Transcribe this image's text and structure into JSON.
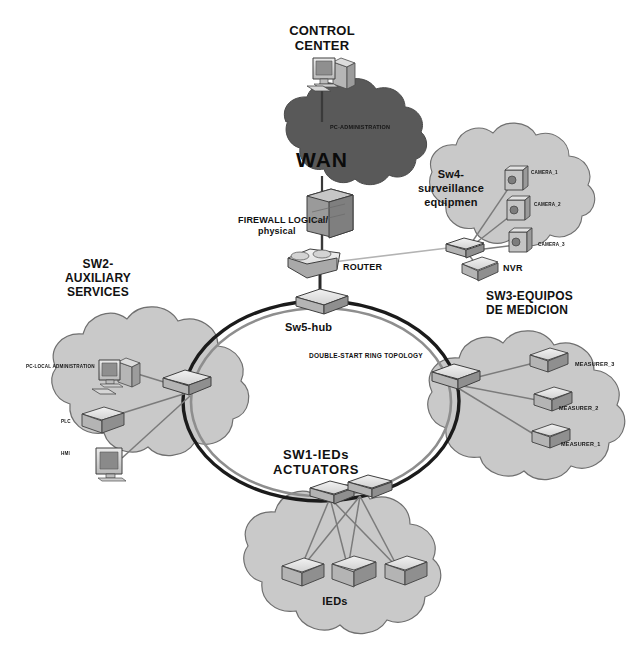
{
  "diagram": {
    "type": "network-topology-diagram",
    "background": "#ffffff"
  },
  "colors": {
    "wan_cloud": "#595959",
    "zone_cloud": "#c9c9c9",
    "cloud_outline": "#6e6e6e",
    "ring_line": "#1a1a1a",
    "ring_inner_line": "#8a8a8a",
    "link_line": "#777777",
    "device_fill": "#d9d9d9",
    "device_shade": "#a8a8a8",
    "device_outline": "#4a4a4a",
    "text": "#111111"
  },
  "nodes": {
    "control_center": {
      "label": "CONTROL\nCENTER",
      "label_line1": "CONTROL",
      "label_line2": "CENTER",
      "icon": "desktop-computer"
    },
    "wan": {
      "label": "WAN",
      "icon": "cloud",
      "inner_label": "PC-ADMINISTRATION"
    },
    "firewall": {
      "label_line1": "FIREWALL LOGICal/",
      "label_line2": "physical",
      "icon": "firewall-brick"
    },
    "router": {
      "label": "ROUTER",
      "icon": "router"
    },
    "hub": {
      "label": "Sw5-hub",
      "icon": "switch"
    },
    "ring": {
      "label": "DOUBLE-START RING TOPOLOGY"
    }
  },
  "zones": [
    {
      "id": "sw2",
      "title_lines": [
        "SW2-",
        "AUXILIARY",
        "SERVICES"
      ],
      "devices": [
        {
          "name": "PC-LOCAL ADMINISTRATION",
          "icon": "desktop-computer"
        },
        {
          "name": "PLC",
          "icon": "server-box"
        },
        {
          "name": "HMI",
          "icon": "monitor"
        }
      ]
    },
    {
      "id": "sw3",
      "title_lines": [
        "SW3-EQUIPOS",
        "DE MEDICION"
      ],
      "devices": [
        {
          "name": "MEASURER_3",
          "icon": "server-box"
        },
        {
          "name": "MEASURER_2",
          "icon": "server-box"
        },
        {
          "name": "MEASURER_1",
          "icon": "server-box"
        }
      ]
    },
    {
      "id": "sw4",
      "title_lines": [
        "Sw4-",
        "surveillance",
        "equipmen"
      ],
      "devices": [
        {
          "name": "CAMERA_1",
          "icon": "camera"
        },
        {
          "name": "CAMERA_2",
          "icon": "camera"
        },
        {
          "name": "CAMERA_3",
          "icon": "camera"
        },
        {
          "name": "NVR",
          "icon": "nvr-box"
        }
      ]
    },
    {
      "id": "sw1",
      "title_lines": [
        "SW1-IEDs",
        "ACTUATORS"
      ],
      "cloud_label": "IEDs",
      "devices": [
        {
          "name": "IED-1",
          "icon": "ied-box"
        },
        {
          "name": "IED-2",
          "icon": "ied-box"
        },
        {
          "name": "IED-3",
          "icon": "ied-box"
        }
      ]
    }
  ],
  "labels": {
    "control_center_l1": "CONTROL",
    "control_center_l2": "CENTER",
    "wan": "WAN",
    "pc_administration": "PC-ADMINISTRATION",
    "firewall_l1": "FIREWALL LOGICal/",
    "firewall_l2": "physical",
    "router": "ROUTER",
    "hub": "Sw5-hub",
    "ring_topology": "DOUBLE-START RING TOPOLOGY",
    "sw2_l1": "SW2-",
    "sw2_l2": "AUXILIARY",
    "sw2_l3": "SERVICES",
    "sw3_l1": "SW3-EQUIPOS",
    "sw3_l2": "DE MEDICION",
    "sw4_l1": "Sw4-",
    "sw4_l2": "surveillance",
    "sw4_l3": "equipmen",
    "sw1_l1": "SW1-IEDs",
    "sw1_l2": "ACTUATORS",
    "ieds": "IEDs",
    "pc_local_admin": "PC-LOCAL ADMINISTRATION",
    "plc": "PLC",
    "hmi": "HMI",
    "nvr": "NVR",
    "camera_1": "CAMERA_1",
    "camera_2": "CAMERA_2",
    "camera_3": "CAMERA_3",
    "measurer_1": "MEASURER_1",
    "measurer_2": "MEASURER_2",
    "measurer_3": "MEASURER_3"
  }
}
